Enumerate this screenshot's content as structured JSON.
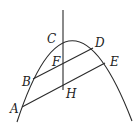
{
  "diagram": {
    "type": "geometry",
    "labels": {
      "A": "A",
      "B": "B",
      "C": "C",
      "D": "D",
      "E": "E",
      "F": "F",
      "H": "H"
    },
    "segments": [
      {
        "from": "B",
        "to": "D",
        "through": "F"
      },
      {
        "from": "A",
        "to": "E",
        "through": "H"
      }
    ],
    "relations": [
      "BD ∥ AE",
      "C, F, H collinear on vertical line"
    ],
    "line_color": "#2a2a2a"
  }
}
